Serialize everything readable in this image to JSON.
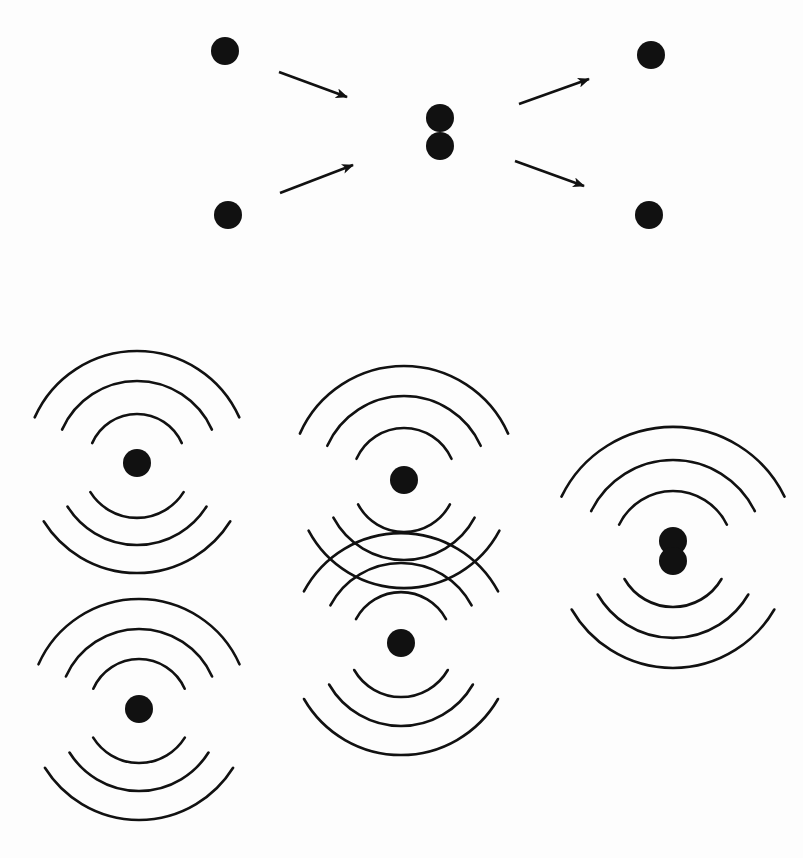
{
  "figure": {
    "width": 803,
    "height": 858,
    "background": "#fdfdfd",
    "ink": "#111111",
    "stroke_width": 2.6,
    "particle_radius": 14
  },
  "collision_panel": {
    "description": "Two particles approach, merge, then scatter apart",
    "particles": [
      {
        "id": "incoming-top",
        "cx": 225,
        "cy": 51
      },
      {
        "id": "incoming-bottom",
        "cx": 228,
        "cy": 215
      },
      {
        "id": "merged-top",
        "cx": 440,
        "cy": 118
      },
      {
        "id": "merged-bottom",
        "cx": 440,
        "cy": 146
      },
      {
        "id": "outgoing-top",
        "cx": 651,
        "cy": 55
      },
      {
        "id": "outgoing-bottom",
        "cx": 649,
        "cy": 215
      }
    ],
    "arrows": [
      {
        "id": "arrow-in-top",
        "x1": 279,
        "y1": 72,
        "x2": 347,
        "y2": 97
      },
      {
        "id": "arrow-in-bottom",
        "x1": 280,
        "y1": 193,
        "x2": 353,
        "y2": 165
      },
      {
        "id": "arrow-out-top",
        "x1": 519,
        "y1": 104,
        "x2": 589,
        "y2": 79
      },
      {
        "id": "arrow-out-bottom",
        "x1": 515,
        "y1": 161,
        "x2": 584,
        "y2": 186
      }
    ]
  },
  "wave_panel": {
    "description": "Particles emitting wavefronts; separate, overlapping (interference), and merged",
    "emitters": [
      {
        "id": "left-top-emitter",
        "dots": [
          {
            "cx": 137,
            "cy": 463
          }
        ],
        "upper_radii": [
          49,
          82,
          112
        ],
        "lower_radii": [
          55,
          82,
          110
        ],
        "upper_half_angle": 66,
        "lower_half_angle": 58
      },
      {
        "id": "left-bottom-emitter",
        "dots": [
          {
            "cx": 139,
            "cy": 709
          }
        ],
        "upper_radii": [
          50,
          80,
          110
        ],
        "lower_radii": [
          54,
          82,
          111
        ],
        "upper_half_angle": 66,
        "lower_half_angle": 58
      },
      {
        "id": "center-top-emitter",
        "dots": [
          {
            "cx": 404,
            "cy": 480
          }
        ],
        "upper_radii": [
          52,
          84,
          114
        ],
        "lower_radii": [
          52,
          80,
          108
        ],
        "upper_half_angle": 66,
        "lower_half_angle": 62
      },
      {
        "id": "center-bottom-emitter",
        "dots": [
          {
            "cx": 401,
            "cy": 643
          }
        ],
        "upper_radii": [
          51,
          80,
          110
        ],
        "lower_radii": [
          54,
          83,
          112
        ],
        "upper_half_angle": 62,
        "lower_half_angle": 60
      },
      {
        "id": "right-merged-emitter",
        "dots": [
          {
            "cx": 673,
            "cy": 541
          },
          {
            "cx": 673,
            "cy": 561
          }
        ],
        "upper_radii": [
          60,
          91,
          124
        ],
        "lower_radii": [
          56,
          87,
          117
        ],
        "center_y": 551,
        "upper_half_angle": 64,
        "lower_half_angle": 60
      }
    ]
  }
}
